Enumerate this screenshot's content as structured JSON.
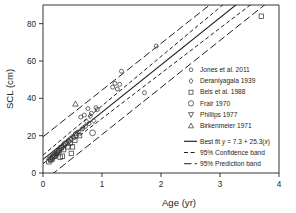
{
  "chart_data": {
    "type": "scatter",
    "title": "",
    "xlabel": "Age (yr)",
    "ylabel": "SCL (cm)",
    "xlim": [
      0,
      4
    ],
    "ylim": [
      0,
      90
    ],
    "xticks": [
      0,
      1,
      2,
      3,
      4
    ],
    "yticks": [
      0,
      20,
      40,
      60,
      80
    ],
    "xticklabels": [
      "0",
      "1",
      "2",
      "3",
      "4"
    ],
    "yticklabels": [
      "0",
      "20",
      "40",
      "60",
      "80"
    ],
    "grid": false,
    "legend_position": "right-inside",
    "fit": {
      "label": "Best fit y = 7.3 + 25.3(x)",
      "intercept": 7.3,
      "slope": 25.3,
      "style": "solid"
    },
    "bands": [
      {
        "label": "95% Confidence band",
        "style": "dashed",
        "upper_intercept": 9.6,
        "upper_slope": 26.4,
        "lower_intercept": 5.0,
        "lower_slope": 24.2
      },
      {
        "label": "95% Prediction band",
        "style": "long-dashed",
        "upper_intercept": 19.4,
        "upper_slope": 25.0,
        "lower_intercept": -4.6,
        "lower_slope": 25.2
      }
    ],
    "series": [
      {
        "name": "Jones et al. 2011",
        "marker": "circle-small",
        "points": [
          [
            0.22,
            10.0
          ],
          [
            0.26,
            11.5
          ],
          [
            0.3,
            13.0
          ],
          [
            0.33,
            14.5
          ],
          [
            0.36,
            15.0
          ],
          [
            0.4,
            16.5
          ],
          [
            0.43,
            17.5
          ],
          [
            0.47,
            18.5
          ],
          [
            0.5,
            19.5
          ],
          [
            0.55,
            21.0
          ],
          [
            0.6,
            22.0
          ],
          [
            0.66,
            23.5
          ],
          [
            0.72,
            25.0
          ],
          [
            0.78,
            26.5
          ],
          [
            0.64,
            30.0
          ],
          [
            0.7,
            31.0
          ],
          [
            0.76,
            34.5
          ],
          [
            0.82,
            32.0
          ],
          [
            0.9,
            35.0
          ],
          [
            0.92,
            34.0
          ],
          [
            1.18,
            46.0
          ],
          [
            1.22,
            48.0
          ],
          [
            1.26,
            45.0
          ],
          [
            1.3,
            47.5
          ],
          [
            1.33,
            54.5
          ],
          [
            1.72,
            43.0
          ],
          [
            1.92,
            68.0
          ]
        ]
      },
      {
        "name": "Deraniyagala 1939",
        "marker": "diamond",
        "points": [
          [
            0.14,
            8.0
          ],
          [
            0.18,
            9.5
          ],
          [
            0.24,
            11.0
          ],
          [
            0.28,
            12.5
          ],
          [
            0.34,
            14.0
          ],
          [
            0.38,
            15.5
          ],
          [
            0.44,
            17.0
          ],
          [
            0.52,
            19.0
          ],
          [
            0.58,
            21.5
          ],
          [
            0.68,
            24.0
          ],
          [
            0.74,
            27.5
          ],
          [
            0.8,
            30.5
          ],
          [
            0.86,
            28.0
          ]
        ]
      },
      {
        "name": "Bels et al. 1988",
        "marker": "square",
        "points": [
          [
            0.1,
            6.0
          ],
          [
            0.13,
            7.0
          ],
          [
            0.16,
            8.5
          ],
          [
            0.2,
            9.0
          ],
          [
            0.23,
            10.5
          ],
          [
            0.27,
            12.0
          ],
          [
            0.31,
            13.5
          ],
          [
            0.35,
            12.5
          ],
          [
            0.29,
            8.5
          ],
          [
            0.33,
            9.0
          ],
          [
            0.42,
            14.0
          ],
          [
            0.46,
            16.0
          ],
          [
            0.5,
            14.0
          ],
          [
            0.54,
            17.5
          ],
          [
            0.62,
            20.0
          ],
          [
            0.48,
            10.5
          ],
          [
            3.7,
            84.0
          ]
        ]
      },
      {
        "name": "Frair 1970",
        "marker": "circle-large",
        "points": [
          [
            0.12,
            7.5
          ],
          [
            0.19,
            9.5
          ],
          [
            0.25,
            11.5
          ],
          [
            0.37,
            15.5
          ],
          [
            0.56,
            20.5
          ],
          [
            0.84,
            21.5
          ]
        ]
      },
      {
        "name": "Phillips 1977",
        "marker": "triangle-down",
        "points": [
          [
            0.17,
            8.0
          ],
          [
            0.21,
            9.0
          ],
          [
            0.24,
            10.0
          ]
        ]
      },
      {
        "name": "Birkenmeier 1971",
        "marker": "triangle-up",
        "points": [
          [
            0.55,
            37.0
          ],
          [
            0.15,
            7.5
          ]
        ]
      }
    ]
  },
  "legend": {
    "series_entries": [
      {
        "label": "Jones et al. 2011",
        "marker": "circle-small"
      },
      {
        "label": "Deraniyagala 1939",
        "marker": "diamond"
      },
      {
        "label": "Bels et al. 1988",
        "marker": "square"
      },
      {
        "label": "Frair 1970",
        "marker": "circle-large"
      },
      {
        "label": "Phillips 1977",
        "marker": "triangle-down"
      },
      {
        "label": "Birkenmeier 1971",
        "marker": "triangle-up"
      }
    ],
    "line_entries": [
      {
        "label": "Best fit y = 7.3 + 25.3(x)",
        "style": "solid"
      },
      {
        "label": "95% Confidence band",
        "style": "dashed"
      },
      {
        "label": "95% Prediction band",
        "style": "long-dashed"
      }
    ]
  },
  "colors": {
    "ink": "#231f20",
    "marker_stroke": "#3a3a3a",
    "background": "#ffffff"
  }
}
